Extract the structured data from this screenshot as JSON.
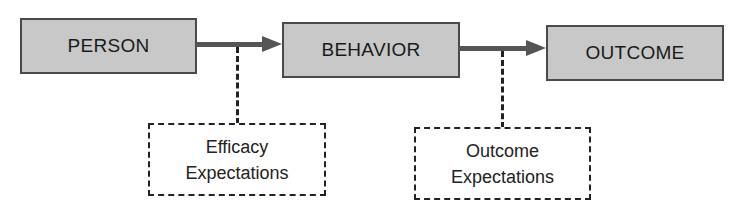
{
  "diagram": {
    "nodes": [
      {
        "id": "person",
        "label": "PERSON",
        "style": "solid"
      },
      {
        "id": "behavior",
        "label": "BEHAVIOR",
        "style": "solid"
      },
      {
        "id": "outcome",
        "label": "OUTCOME",
        "style": "solid"
      },
      {
        "id": "efficacy",
        "label_lines": [
          "Efficacy",
          "Expectations"
        ],
        "style": "dashed"
      },
      {
        "id": "outcome_expectations",
        "label_lines": [
          "Outcome",
          "Expectations"
        ],
        "style": "dashed"
      }
    ],
    "edges": [
      {
        "from": "person",
        "to": "behavior",
        "type": "arrow"
      },
      {
        "from": "behavior",
        "to": "outcome",
        "type": "arrow"
      },
      {
        "from": "efficacy",
        "to": "person-behavior-arrow",
        "type": "dashed"
      },
      {
        "from": "outcome_expectations",
        "to": "behavior-outcome-arrow",
        "type": "dashed"
      }
    ]
  },
  "colors": {
    "box_fill": "#c8c8c8",
    "box_border": "#4a4a4a",
    "arrow": "#555555"
  }
}
